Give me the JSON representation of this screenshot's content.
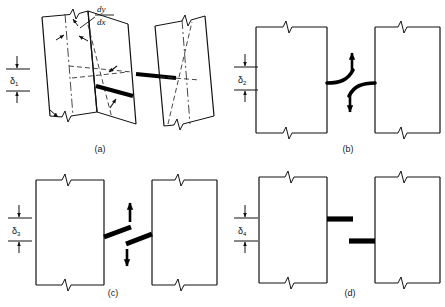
{
  "figure": {
    "type": "engineering-diagram",
    "panels": [
      {
        "id": "a",
        "caption": "(a)",
        "dimension_label": "δ",
        "dimension_subscript": "1",
        "annotation_numerator": "dy",
        "annotation_denominator": "dx",
        "style": "tilted-blocks-with-centerlines"
      },
      {
        "id": "b",
        "caption": "(b)",
        "dimension_label": "δ",
        "dimension_subscript": "2",
        "style": "upright-blocks-curved-arrows"
      },
      {
        "id": "c",
        "caption": "(c)",
        "dimension_label": "δ",
        "dimension_subscript": "3",
        "style": "upright-blocks-sloped-bars"
      },
      {
        "id": "d",
        "caption": "(d)",
        "dimension_label": "δ",
        "dimension_subscript": "4",
        "style": "upright-blocks-horizontal-bars"
      }
    ],
    "colors": {
      "line": "#1a1a1a",
      "background": "#ffffff",
      "bar": "#000000"
    }
  }
}
